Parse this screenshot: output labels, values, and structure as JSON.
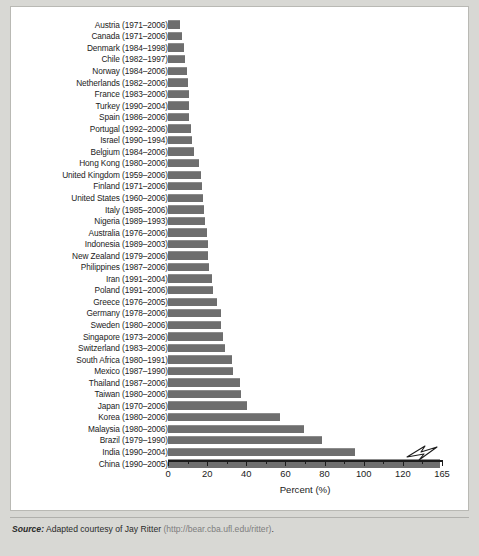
{
  "figure": {
    "axis_title": "Percent (%)",
    "source_label": "Source:",
    "source_text": " Adapted courtesy of Jay Ritter ",
    "source_url": "(http://bear.cba.ufl.edu/ritter)",
    "source_end": "."
  },
  "axis": {
    "ticks_major": [
      "0",
      "20",
      "40",
      "60",
      "80",
      "100",
      "120",
      "165"
    ],
    "tick_values": [
      0,
      20,
      40,
      60,
      80,
      100,
      120,
      140
    ],
    "minor_step": 10,
    "max_display": 140,
    "break_at": 130,
    "break_label": "165"
  },
  "colors": {
    "bar": "#6e6e6e",
    "bar_top": "#8c8c8c",
    "axis": "#1b1b1b",
    "card": "#ffffff",
    "page": "#d8d8d4",
    "source_url": "#7e7e7e"
  },
  "chart_data": {
    "type": "bar",
    "orientation": "horizontal",
    "title": "",
    "xlabel": "Percent (%)",
    "ylabel": "",
    "xlim": [
      0,
      165
    ],
    "grid": false,
    "legend": "none",
    "categories": [
      "Austria (1971–2006)",
      "Canada (1971–2006)",
      "Denmark  (1984–1998)",
      "Chile (1982–1997)",
      "Norway (1984–2006)",
      "Netherlands (1982–2006)",
      "France (1983–2006)",
      "Turkey (1990–2004)",
      "Spain (1986–2006)",
      "Portugal (1992–2006)",
      "Israel (1990–1994)",
      "Belgium (1984–2006)",
      "Hong Kong (1980–2006)",
      "United Kingdom (1959–2006)",
      "Finland (1971–2006)",
      "United States (1960–2006)",
      "Italy (1985–2006)",
      "Nigeria (1989–1993)",
      "Australia (1976–2006)",
      "Indonesia (1989–2003)",
      "New Zealand (1979–2006)",
      "Philippines (1987–2006)",
      "Iran (1991–2004)",
      "Poland (1991–2006)",
      "Greece (1976–2005)",
      "Germany (1978–2006)",
      "Sweden (1980–2006)",
      "Singapore (1973–2006)",
      "Switzerland (1983–2006)",
      "South Africa (1980–1991)",
      "Mexico (1987–1990)",
      "Thailand (1987–2006)",
      "Taiwan (1980–2006)",
      "Japan (1970–2006)",
      "Korea (1980–2006)",
      "Malaysia (1980–2006)",
      "Brazil (1979–1990)",
      "India (1990–2004)",
      "China (1990–2005)"
    ],
    "values": [
      6.3,
      7.1,
      8.1,
      8.8,
      9.6,
      10.2,
      10.7,
      10.8,
      10.9,
      11.6,
      12.1,
      13.5,
      15.9,
      16.8,
      17.2,
      18.0,
      18.2,
      19.1,
      19.8,
      20.2,
      20.3,
      21.2,
      22.4,
      22.9,
      25.1,
      26.9,
      27.3,
      28.3,
      29.3,
      32.7,
      33.0,
      36.6,
      37.2,
      40.2,
      57.4,
      69.6,
      78.5,
      95.4,
      164.5
    ],
    "value_unit": "%",
    "note": "Average first-day IPO returns by country"
  }
}
